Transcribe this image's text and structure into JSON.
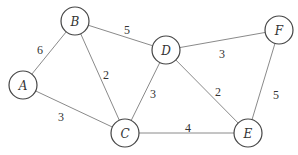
{
  "graph": {
    "type": "weighted-undirected-graph",
    "node_radius": 14,
    "nodes": [
      {
        "id": "A",
        "label": "A",
        "x": 23,
        "y": 85
      },
      {
        "id": "B",
        "label": "B",
        "x": 75,
        "y": 21
      },
      {
        "id": "C",
        "label": "C",
        "x": 125,
        "y": 133
      },
      {
        "id": "D",
        "label": "D",
        "x": 166,
        "y": 50
      },
      {
        "id": "E",
        "label": "E",
        "x": 248,
        "y": 133
      },
      {
        "id": "F",
        "label": "F",
        "x": 279,
        "y": 30
      }
    ],
    "edges": [
      {
        "from": "A",
        "to": "B",
        "weight": "6",
        "lx": 40,
        "ly": 50
      },
      {
        "from": "B",
        "to": "D",
        "weight": "5",
        "lx": 127,
        "ly": 30
      },
      {
        "from": "B",
        "to": "C",
        "weight": "2",
        "lx": 106,
        "ly": 75
      },
      {
        "from": "A",
        "to": "C",
        "weight": "3",
        "lx": 61,
        "ly": 117
      },
      {
        "from": "C",
        "to": "D",
        "weight": "3",
        "lx": 153,
        "ly": 94
      },
      {
        "from": "D",
        "to": "F",
        "weight": "3",
        "lx": 222,
        "ly": 54
      },
      {
        "from": "D",
        "to": "E",
        "weight": "2",
        "lx": 218,
        "ly": 92
      },
      {
        "from": "C",
        "to": "E",
        "weight": "4",
        "lx": 188,
        "ly": 128
      },
      {
        "from": "F",
        "to": "E",
        "weight": "5",
        "lx": 276,
        "ly": 95
      }
    ]
  }
}
